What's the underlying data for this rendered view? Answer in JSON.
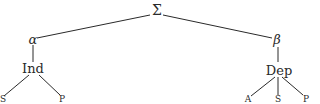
{
  "tree": {
    "root": {
      "label": "Σ"
    },
    "left": {
      "label": "α",
      "child": {
        "label": "Ind",
        "leaves": [
          "S",
          "P"
        ]
      }
    },
    "right": {
      "label": "β",
      "child": {
        "label": "Dep",
        "leaves": [
          "A",
          "S",
          "P"
        ]
      }
    }
  },
  "colors": {
    "line": "#2a2a2a",
    "text": "#2a2a2a",
    "background": "#ffffff"
  }
}
